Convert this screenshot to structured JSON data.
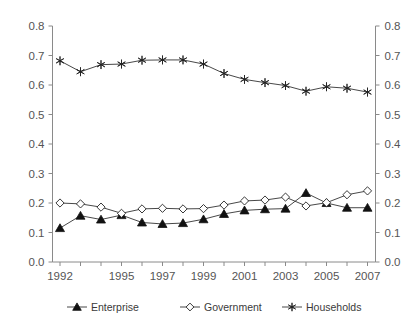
{
  "chart_data": {
    "type": "line",
    "title": "",
    "subtitle": "",
    "xlabel": "",
    "ylabel": "",
    "ylim": [
      0.0,
      0.8
    ],
    "xlim": [
      1992,
      2007
    ],
    "grid": false,
    "legend_position": "bottom",
    "dual_y_axis": true,
    "x": [
      1992,
      1993,
      1994,
      1995,
      1996,
      1997,
      1998,
      1999,
      2000,
      2001,
      2002,
      2003,
      2004,
      2005,
      2006,
      2007
    ],
    "x_tick_labels": [
      "1992",
      "",
      "",
      "1995",
      "",
      "1997",
      "",
      "1999",
      "",
      "2001",
      "",
      "2003",
      "",
      "2005",
      "",
      "2007"
    ],
    "y_tick_labels_left": [
      "0.8",
      "0.7",
      "0.6",
      "0.5",
      "0.4",
      "0.3",
      "0.2",
      "0.1",
      "0.0"
    ],
    "y_tick_labels_right": [
      "0.8",
      "0.7",
      "0.6",
      "0.5",
      "0.4",
      "0.3",
      "0.2",
      "0.1",
      "0.0"
    ],
    "y_ticks": [
      0.8,
      0.7,
      0.6,
      0.5,
      0.4,
      0.3,
      0.2,
      0.1,
      0.0
    ],
    "series": [
      {
        "name": "Enterprise",
        "marker": "triangle-filled",
        "color": "#111111",
        "values": [
          0.115,
          0.157,
          0.144,
          0.159,
          0.134,
          0.129,
          0.132,
          0.145,
          0.163,
          0.175,
          0.179,
          0.181,
          0.234,
          0.2,
          0.184,
          0.184
        ]
      },
      {
        "name": "Government",
        "marker": "diamond-open",
        "color": "#222222",
        "values": [
          0.2,
          0.197,
          0.186,
          0.165,
          0.18,
          0.182,
          0.18,
          0.181,
          0.193,
          0.207,
          0.21,
          0.22,
          0.19,
          0.201,
          0.228,
          0.241
        ]
      },
      {
        "name": "Households",
        "marker": "star",
        "color": "#222222",
        "values": [
          0.682,
          0.645,
          0.669,
          0.671,
          0.684,
          0.685,
          0.685,
          0.671,
          0.639,
          0.619,
          0.608,
          0.598,
          0.579,
          0.594,
          0.589,
          0.576
        ]
      }
    ]
  },
  "legend": {
    "items": [
      {
        "label": "Enterprise",
        "marker": "triangle-filled"
      },
      {
        "label": "Government",
        "marker": "diamond-open"
      },
      {
        "label": "Households",
        "marker": "star"
      }
    ]
  }
}
